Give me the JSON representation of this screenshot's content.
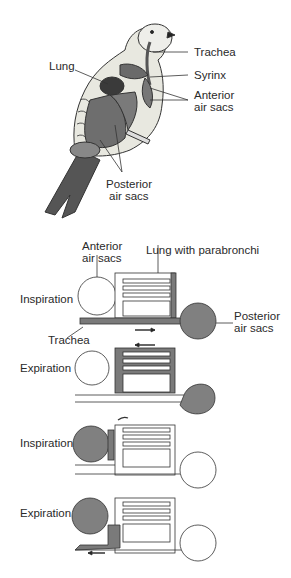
{
  "bird": {
    "labels": {
      "trachea": "Trachea",
      "lung": "Lung",
      "syrinx": "Syrinx",
      "anterior_1": "Anterior",
      "anterior_2": "air sacs",
      "posterior_1": "Posterior",
      "posterior_2": "air sacs"
    }
  },
  "cycle": {
    "anterior_1": "Anterior",
    "anterior_2": "air sacs",
    "lung_label": "Lung with parabronchi",
    "posterior_1": "Posterior",
    "posterior_2": "air sacs",
    "trachea": "Trachea",
    "stages": [
      {
        "label": "Inspiration"
      },
      {
        "label": "Expiration"
      },
      {
        "label": "Inspiration"
      },
      {
        "label": "Expiration"
      }
    ]
  },
  "colors": {
    "fill_gray": "#7a7a7a",
    "sac_gray": "#808080",
    "line": "#333333"
  }
}
